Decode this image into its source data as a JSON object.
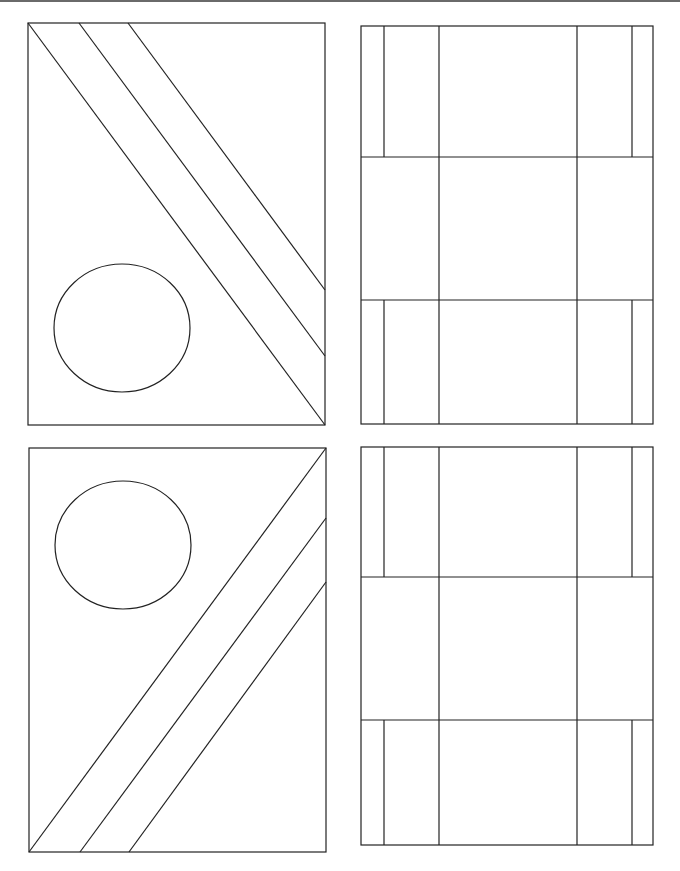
{
  "page": {
    "width": 680,
    "height": 871,
    "stroke_color": "#222222",
    "background": "#ffffff"
  },
  "panels": [
    {
      "id": "top-left",
      "frame": {
        "x": 28,
        "y": 23,
        "w": 297,
        "h": 402
      },
      "diagonals": [
        {
          "x1": 28,
          "y1": 23,
          "x2": 325,
          "y2": 425
        },
        {
          "x1": 79,
          "y1": 23,
          "x2": 325,
          "y2": 355
        },
        {
          "x1": 128,
          "y1": 23,
          "x2": 325,
          "y2": 290
        }
      ],
      "circle": {
        "cx": 123,
        "cy": 328,
        "rx": 68,
        "ry": 64
      }
    },
    {
      "id": "top-right",
      "frame": {
        "x": 361,
        "y": 26,
        "w": 292,
        "h": 398
      },
      "verticals": [
        384,
        439,
        577,
        632
      ],
      "horizontals": [
        157,
        300
      ],
      "notes": "outer strips (361-384, 632-653) only span top & bottom bands; middle band spans full width"
    },
    {
      "id": "bottom-left",
      "frame": {
        "x": 29,
        "y": 448,
        "w": 297,
        "h": 404
      },
      "diagonals": [
        {
          "x1": 29,
          "y1": 852,
          "x2": 326,
          "y2": 448
        },
        {
          "x1": 80,
          "y1": 852,
          "x2": 326,
          "y2": 518
        },
        {
          "x1": 129,
          "y1": 852,
          "x2": 326,
          "y2": 582
        }
      ],
      "circle": {
        "cx": 124,
        "cy": 544,
        "rx": 68,
        "ry": 64
      }
    },
    {
      "id": "bottom-right",
      "frame": {
        "x": 361,
        "y": 447,
        "w": 292,
        "h": 398
      },
      "verticals": [
        384,
        439,
        577,
        632
      ],
      "horizontals": [
        577,
        720
      ]
    }
  ]
}
